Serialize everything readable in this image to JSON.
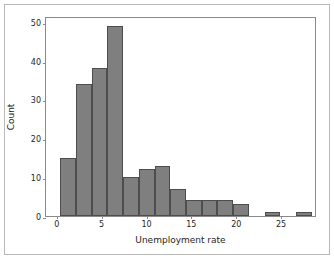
{
  "chart_data": {
    "type": "bar",
    "title": "",
    "subtitle": "",
    "xlabel": "Unemployment rate",
    "ylabel": "Count",
    "xlim": [
      -1.2,
      29.0
    ],
    "ylim": [
      0,
      51.5
    ],
    "grid": false,
    "legend": null,
    "xticks": [
      0,
      5,
      10,
      15,
      20,
      25
    ],
    "yticks": [
      0,
      10,
      20,
      30,
      40,
      50
    ],
    "xtick_labels": [
      "0",
      "5",
      "10",
      "15",
      "20",
      "25"
    ],
    "ytick_labels": [
      "0",
      "10",
      "20",
      "30",
      "40",
      "50"
    ],
    "bin_width": 1.75,
    "bin_edges": [
      0.4,
      2.15,
      3.9,
      5.65,
      7.4,
      9.15,
      10.9,
      12.65,
      14.4,
      16.15,
      17.9,
      19.65,
      21.4,
      23.15,
      24.9,
      26.65,
      28.4
    ],
    "values": [
      15,
      34,
      38,
      49,
      10,
      12,
      13,
      7,
      4,
      4,
      4,
      3,
      0,
      1,
      0,
      1
    ],
    "bar_color": "#7f7f7f",
    "bar_edge_color": "#4d4d4d",
    "axes_color": "#8a8a8a",
    "frame_color": "#b9b9b9",
    "background": "#ffffff",
    "text_color": "#262626"
  }
}
